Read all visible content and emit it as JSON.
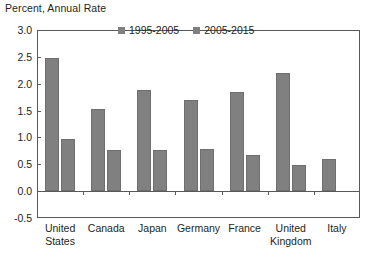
{
  "chart_data": {
    "type": "bar",
    "title": "Percent, Annual Rate",
    "xlabel": "",
    "ylabel": "Percent, Annual Rate",
    "ylim": [
      -0.5,
      3.0
    ],
    "ytick_labels": [
      "3.0",
      "2.5",
      "2.0",
      "1.5",
      "1.0",
      "0.5",
      "0.0",
      "-0.5"
    ],
    "ytick_values": [
      3.0,
      2.5,
      2.0,
      1.5,
      1.0,
      0.5,
      0.0,
      -0.5
    ],
    "grid": false,
    "legend_position": "top-center",
    "categories": [
      "United States",
      "Canada",
      "Japan",
      "Germany",
      "France",
      "United Kingdom",
      "Italy"
    ],
    "category_lines": [
      [
        "United",
        "States"
      ],
      [
        "Canada",
        ""
      ],
      [
        "Japan",
        ""
      ],
      [
        "Germany",
        ""
      ],
      [
        "France",
        ""
      ],
      [
        "United",
        "Kingdom"
      ],
      [
        "Italy",
        ""
      ]
    ],
    "series": [
      {
        "name": "1995-2005",
        "color": "#808080",
        "values": [
          2.47,
          1.53,
          1.89,
          1.7,
          1.84,
          2.2,
          0.6
        ]
      },
      {
        "name": "2005-2015",
        "color": "#808080",
        "values": [
          0.97,
          0.77,
          0.76,
          0.78,
          0.68,
          0.49,
          -0.01
        ]
      }
    ]
  },
  "legend": {
    "items": [
      {
        "label": "1995-2005"
      },
      {
        "label": "2005-2015"
      }
    ]
  },
  "colors": {
    "bar": "#808080",
    "axis": "#58595b",
    "text": "#231f20",
    "background": "#ffffff"
  }
}
